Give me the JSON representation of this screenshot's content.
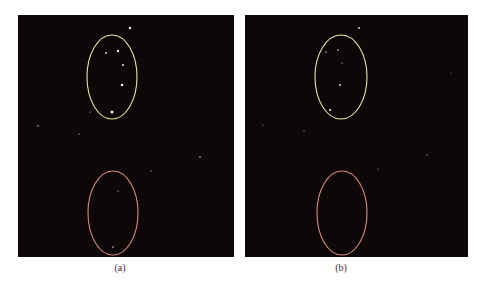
{
  "figure": {
    "panels": [
      {
        "id": "a",
        "caption": "(a)",
        "background": "#0e0708",
        "ellipses": [
          {
            "label": "upper-region",
            "color": "#e8e4a0",
            "cx": 94,
            "cy": 62,
            "rx": 25,
            "ry": 42
          },
          {
            "label": "lower-region",
            "color": "#d98a7a",
            "cx": 95,
            "cy": 198,
            "rx": 25,
            "ry": 42
          }
        ],
        "points": [
          {
            "x": 112,
            "y": 13,
            "r": 1.2
          },
          {
            "x": 88,
            "y": 38,
            "r": 0.9
          },
          {
            "x": 100,
            "y": 36,
            "r": 1.2
          },
          {
            "x": 105,
            "y": 50,
            "r": 1.0
          },
          {
            "x": 104,
            "y": 70,
            "r": 1.3
          },
          {
            "x": 94,
            "y": 97,
            "r": 1.6
          },
          {
            "x": 72,
            "y": 97,
            "r": 0.6
          },
          {
            "x": 20,
            "y": 111,
            "r": 0.7
          },
          {
            "x": 61,
            "y": 119,
            "r": 0.6
          },
          {
            "x": 182,
            "y": 142,
            "r": 0.8
          },
          {
            "x": 133,
            "y": 156,
            "r": 0.6
          },
          {
            "x": 100,
            "y": 176,
            "r": 0.6
          },
          {
            "x": 95,
            "y": 232,
            "r": 0.8
          }
        ]
      },
      {
        "id": "b",
        "caption": "(b)",
        "background": "#0e0708",
        "ellipses": [
          {
            "label": "upper-region",
            "color": "#e8e4a0",
            "cx": 96,
            "cy": 62,
            "rx": 26,
            "ry": 42
          },
          {
            "label": "lower-region",
            "color": "#d98a7a",
            "cx": 97,
            "cy": 198,
            "rx": 25,
            "ry": 42
          }
        ],
        "points": [
          {
            "x": 114,
            "y": 13,
            "r": 0.9
          },
          {
            "x": 81,
            "y": 37,
            "r": 0.7
          },
          {
            "x": 93,
            "y": 35,
            "r": 0.8
          },
          {
            "x": 97,
            "y": 48,
            "r": 0.6
          },
          {
            "x": 95,
            "y": 70,
            "r": 0.9
          },
          {
            "x": 85,
            "y": 95,
            "r": 1.1
          },
          {
            "x": 18,
            "y": 110,
            "r": 0.5
          },
          {
            "x": 59,
            "y": 116,
            "r": 0.5
          },
          {
            "x": 182,
            "y": 140,
            "r": 0.6
          },
          {
            "x": 133,
            "y": 154,
            "r": 0.5
          },
          {
            "x": 206,
            "y": 58,
            "r": 0.4
          }
        ]
      }
    ]
  }
}
